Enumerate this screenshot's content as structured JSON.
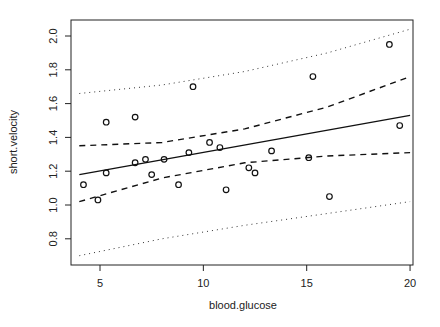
{
  "chart_data": {
    "type": "scatter",
    "title": "",
    "xlabel": "blood.glucose",
    "ylabel": "short.velocity",
    "xlim": [
      3.6,
      20.2
    ],
    "ylim": [
      0.65,
      2.08
    ],
    "xticks": [
      5,
      10,
      15,
      20
    ],
    "xtick_labels": [
      "5",
      "10",
      "15",
      "20"
    ],
    "yticks": [
      0.8,
      1.0,
      1.2,
      1.4,
      1.6,
      1.8,
      2.0
    ],
    "ytick_labels": [
      "0.8",
      "1.0",
      "1.2",
      "1.4",
      "1.6",
      "1.8",
      "2.0"
    ],
    "grid": false,
    "legend": null,
    "points": {
      "x": [
        4.2,
        4.9,
        5.3,
        5.3,
        6.7,
        6.7,
        7.2,
        7.5,
        8.1,
        8.8,
        9.3,
        9.5,
        10.3,
        10.8,
        11.1,
        12.2,
        12.5,
        13.3,
        15.1,
        15.3,
        16.1,
        19.0,
        19.5
      ],
      "y": [
        1.12,
        1.03,
        1.19,
        1.49,
        1.52,
        1.25,
        1.27,
        1.18,
        1.27,
        1.12,
        1.31,
        1.7,
        1.37,
        1.34,
        1.09,
        1.22,
        1.19,
        1.32,
        1.28,
        1.76,
        1.05,
        1.95,
        1.47
      ]
    },
    "series": [
      {
        "name": "fit",
        "style": "solid",
        "x": [
          4.0,
          20.0
        ],
        "y": [
          1.18,
          1.53
        ]
      },
      {
        "name": "confidence-upper",
        "style": "dashed",
        "x": [
          4.0,
          8.0,
          12.0,
          16.0,
          20.0
        ],
        "y": [
          1.35,
          1.37,
          1.45,
          1.58,
          1.76
        ]
      },
      {
        "name": "confidence-lower",
        "style": "dashed",
        "x": [
          4.0,
          8.0,
          12.0,
          16.0,
          20.0
        ],
        "y": [
          1.02,
          1.16,
          1.25,
          1.29,
          1.31
        ]
      },
      {
        "name": "prediction-upper",
        "style": "dotted",
        "x": [
          4.0,
          8.0,
          12.0,
          16.0,
          20.0
        ],
        "y": [
          1.66,
          1.71,
          1.79,
          1.9,
          2.04
        ]
      },
      {
        "name": "prediction-lower",
        "style": "dotted",
        "x": [
          4.0,
          8.0,
          12.0,
          16.0,
          20.0
        ],
        "y": [
          0.7,
          0.8,
          0.88,
          0.95,
          1.02
        ]
      }
    ]
  }
}
